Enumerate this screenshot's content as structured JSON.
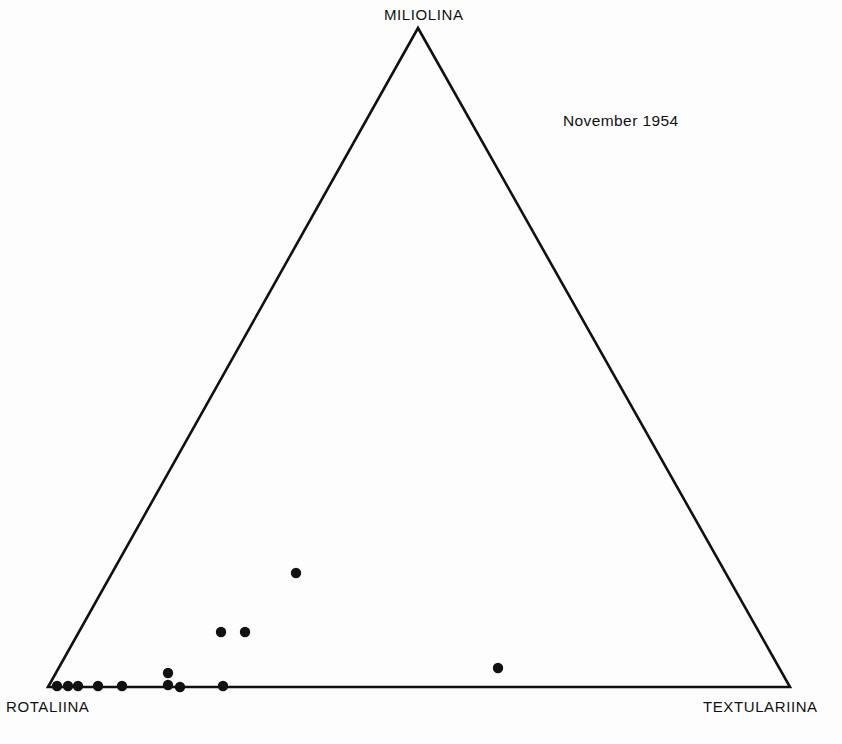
{
  "figure": {
    "background_color": "#fdfdfd",
    "line_color": "#111111",
    "marker_color": "#111111",
    "annotation": "November 1954",
    "vertex_labels": {
      "top": "MILIOLINA",
      "bottom_left": "ROTALIINA",
      "bottom_right": "TEXTULARIINA"
    }
  },
  "chart_data": {
    "type": "scatter",
    "subtype": "ternary",
    "title": "",
    "subtitle": "",
    "annotations": [
      {
        "text": "November 1954",
        "x": 563,
        "y": 112
      }
    ],
    "axes": [
      {
        "name": "ROTALIINA",
        "position": "bottom-left",
        "range": [
          0,
          100
        ],
        "unit": "percent"
      },
      {
        "name": "MILIOLINA",
        "position": "top",
        "range": [
          0,
          100
        ],
        "unit": "percent"
      },
      {
        "name": "TEXTULARIINA",
        "position": "bottom-right",
        "range": [
          0,
          100
        ],
        "unit": "percent"
      }
    ],
    "grid": false,
    "ticks": false,
    "legend": null,
    "xlabel": "",
    "ylabel": "",
    "triangle_pixels": {
      "apex": [
        418,
        28
      ],
      "bottom_left": [
        48,
        687
      ],
      "bottom_right": [
        790,
        687
      ]
    },
    "marker_radius_px": 5.2,
    "point_count": 13,
    "component_order": [
      "rotaliina",
      "miliolina",
      "textulariina"
    ],
    "points": [
      {
        "id": 1,
        "rotaliina": 98.8,
        "miliolina": 0.0,
        "textulariina": 1.2,
        "px": [
          57,
          686
        ]
      },
      {
        "id": 2,
        "rotaliina": 97.3,
        "miliolina": 0.0,
        "textulariina": 2.7,
        "px": [
          68,
          686
        ]
      },
      {
        "id": 3,
        "rotaliina": 96.0,
        "miliolina": 0.0,
        "textulariina": 4.0,
        "px": [
          78,
          686
        ]
      },
      {
        "id": 4,
        "rotaliina": 93.3,
        "miliolina": 0.0,
        "textulariina": 6.7,
        "px": [
          98,
          686
        ]
      },
      {
        "id": 5,
        "rotaliina": 90.0,
        "miliolina": 0.0,
        "textulariina": 10.0,
        "px": [
          122,
          686
        ]
      },
      {
        "id": 6,
        "rotaliina": 82.0,
        "miliolina": 2.1,
        "textulariina": 15.9,
        "px": [
          168,
          673
        ]
      },
      {
        "id": 7,
        "rotaliina": 83.8,
        "miliolina": 0.0,
        "textulariina": 16.2,
        "px": [
          168,
          685
        ]
      },
      {
        "id": 8,
        "rotaliina": 82.2,
        "miliolina": 0.0,
        "textulariina": 17.8,
        "px": [
          180,
          687
        ]
      },
      {
        "id": 9,
        "rotaliina": 76.4,
        "miliolina": 0.0,
        "textulariina": 23.6,
        "px": [
          223,
          686
        ]
      },
      {
        "id": 10,
        "rotaliina": 70.3,
        "miliolina": 8.3,
        "textulariina": 21.4,
        "px": [
          221,
          632
        ]
      },
      {
        "id": 11,
        "rotaliina": 67.1,
        "miliolina": 8.3,
        "textulariina": 24.6,
        "px": [
          245,
          632
        ]
      },
      {
        "id": 12,
        "rotaliina": 56.4,
        "miliolina": 17.3,
        "textulariina": 26.3,
        "px": [
          296,
          573
        ]
      },
      {
        "id": 13,
        "rotaliina": 37.4,
        "miliolina": 2.9,
        "textulariina": 59.7,
        "px": [
          498,
          668
        ]
      }
    ]
  }
}
